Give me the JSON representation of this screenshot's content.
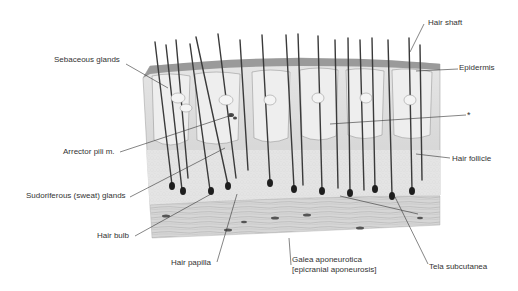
{
  "diagram": {
    "labels": {
      "hair_shaft": "Hair shaft",
      "epidermis": "Epidermis",
      "asterisk": "*",
      "hair_follicle": "Hair follicle",
      "sebaceous_glands": "Sebaceous glands",
      "arrector_pili": "Arrector pili m.",
      "sweat_glands": "Sudoriferous (sweat) glands",
      "hair_bulb": "Hair bulb",
      "hair_papilla": "Hair papilla",
      "galea_line1": "Galea aponeurotica",
      "galea_line2": "[epicranial aponeurosis]",
      "tela_subcutanea": "Tela subcutanea"
    }
  }
}
